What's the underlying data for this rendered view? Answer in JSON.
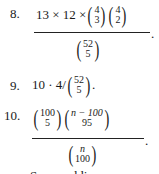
{
  "items": [
    {
      "number": "8.",
      "numerator": {
        "prefix": "13 × 12 × ",
        "binom1": {
          "top": "4",
          "bottom": "3"
        },
        "binom2": {
          "top": "4",
          "bottom": "2"
        }
      },
      "denominator": {
        "binom": {
          "top": "52",
          "bottom": "5"
        }
      },
      "suffix": "."
    },
    {
      "number": "9.",
      "prefix": "10 · 4/",
      "binom": {
        "top": "52",
        "bottom": "5"
      },
      "suffix": "."
    },
    {
      "number": "10.",
      "numerator": {
        "binom1": {
          "top": "100",
          "bottom": "5"
        },
        "binom2": {
          "top": "n − 100",
          "bottom": "95"
        }
      },
      "denominator": {
        "binom": {
          "top": "n",
          "bottom": "100"
        }
      },
      "suffix": "."
    }
  ],
  "clipped_line": "Seven addi"
}
